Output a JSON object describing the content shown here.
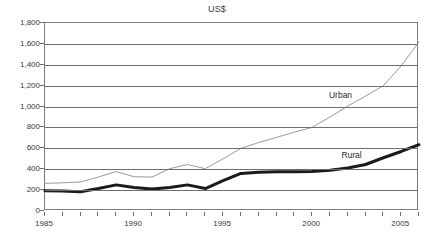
{
  "chart_data": {
    "type": "line",
    "title": "US$",
    "xlabel": "",
    "ylabel": "",
    "xlim": [
      1985,
      2006
    ],
    "ylim": [
      0,
      1800
    ],
    "grid": true,
    "legend_position": "inline-annotation",
    "y_ticks": [
      0,
      200,
      400,
      600,
      800,
      1000,
      1200,
      1400,
      1600,
      1800
    ],
    "y_tick_labels": [
      "0",
      "200",
      "400",
      "600",
      "800",
      "1,000",
      "1,200",
      "1,400",
      "1,600",
      "1,800"
    ],
    "x_ticks": [
      1985,
      1986,
      1987,
      1988,
      1989,
      1990,
      1991,
      1992,
      1993,
      1994,
      1995,
      1996,
      1997,
      1998,
      1999,
      2000,
      2001,
      2002,
      2003,
      2004,
      2005,
      2006
    ],
    "x_tick_labels": [
      {
        "value": 1985,
        "label": "1985"
      },
      {
        "value": 1990,
        "label": "1990"
      },
      {
        "value": 1995,
        "label": "1995"
      },
      {
        "value": 2000,
        "label": "2000"
      },
      {
        "value": 2005,
        "label": "2005"
      }
    ],
    "series": [
      {
        "name": "Urban",
        "color": "#9a9a9a",
        "line_width": 1,
        "annotation": {
          "label": "Urban",
          "x": 2001.0,
          "y": 1090
        },
        "x": [
          1985,
          1986,
          1987,
          1988,
          1989,
          1990,
          1991,
          1992,
          1993,
          1994,
          1995,
          1996,
          1997,
          1998,
          1999,
          2000,
          2001,
          2002,
          2003,
          2004,
          2005,
          2006
        ],
        "values": [
          265,
          270,
          278,
          325,
          378,
          328,
          325,
          405,
          445,
          405,
          500,
          600,
          655,
          705,
          755,
          800,
          900,
          1005,
          1100,
          1200,
          1390,
          1620
        ]
      },
      {
        "name": "Rural",
        "color": "#1a1a1a",
        "line_width": 3,
        "annotation": {
          "label": "Rural",
          "x": 2001.7,
          "y": 520
        },
        "x": [
          1985,
          1986,
          1987,
          1988,
          1989,
          1990,
          1991,
          1992,
          1993,
          1994,
          1995,
          1996,
          1997,
          1998,
          1999,
          2000,
          2001,
          2002,
          2003,
          2004,
          2005,
          2006
        ],
        "values": [
          195,
          192,
          185,
          215,
          250,
          225,
          210,
          225,
          250,
          215,
          290,
          360,
          372,
          375,
          375,
          378,
          390,
          412,
          445,
          510,
          570,
          635
        ]
      }
    ]
  }
}
